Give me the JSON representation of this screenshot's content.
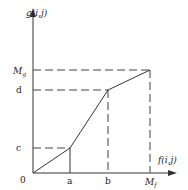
{
  "axes": {
    "y_label": "g(i,j)",
    "x_label": "f(i,j)",
    "origin_label": "0"
  },
  "y_ticks": {
    "c": "c",
    "d": "d",
    "Mg_main": "M",
    "Mg_sub": "g"
  },
  "x_ticks": {
    "a": "a",
    "b": "b",
    "Mf_main": "M",
    "Mf_sub": "f"
  },
  "curve": {
    "type": "piecewise-linear",
    "points": [
      {
        "x": "0",
        "y": "0"
      },
      {
        "x": "a",
        "y": "c"
      },
      {
        "x": "b",
        "y": "d"
      },
      {
        "x": "Mf",
        "y": "Mg"
      }
    ]
  },
  "colors": {
    "line": "#333333",
    "dash": "#444444"
  }
}
